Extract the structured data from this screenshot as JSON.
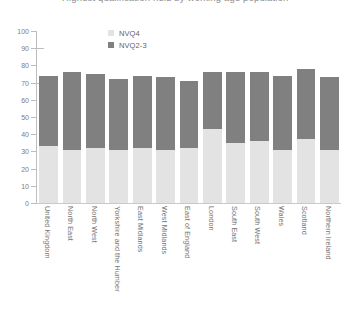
{
  "title": {
    "text": "Highest qualification held by working age population"
  },
  "legend": {
    "position": "top-center",
    "items": [
      {
        "label": "NVQ4",
        "color": "#e3e3e3"
      },
      {
        "label": "NVQ2-3",
        "color": "#808080"
      }
    ]
  },
  "axes": {
    "y": {
      "ticks": [
        "0",
        "10",
        "20",
        "30",
        "40",
        "50",
        "60",
        "70",
        "80",
        "90",
        "100"
      ],
      "min": 0,
      "max": 100
    }
  },
  "chart_data": {
    "type": "bar",
    "subtype": "stacked",
    "title": "Highest qualification held by working age population",
    "xlabel": "",
    "ylabel": "",
    "ylim": [
      0,
      100
    ],
    "ytick_step": 10,
    "grid": false,
    "legend_position": "top-center",
    "categories": [
      "United Kingdom",
      "North East",
      "North West",
      "Yorkshire and the Humber",
      "East Midlands",
      "West Midlands",
      "East of England",
      "London",
      "South East",
      "South West",
      "Wales",
      "Scotland",
      "Northern Ireland"
    ],
    "series": [
      {
        "name": "NVQ4",
        "color": "#e3e3e3",
        "values": [
          33,
          31,
          32,
          31,
          32,
          31,
          32,
          43,
          35,
          36,
          31,
          37,
          31
        ]
      },
      {
        "name": "NVQ2-3",
        "color": "#808080",
        "values": [
          41,
          45,
          43,
          41,
          42,
          42,
          39,
          33,
          41,
          40,
          43,
          41,
          42
        ]
      }
    ],
    "totals": [
      74,
      76,
      75,
      72,
      74,
      73,
      71,
      76,
      76,
      76,
      74,
      78,
      73
    ]
  }
}
